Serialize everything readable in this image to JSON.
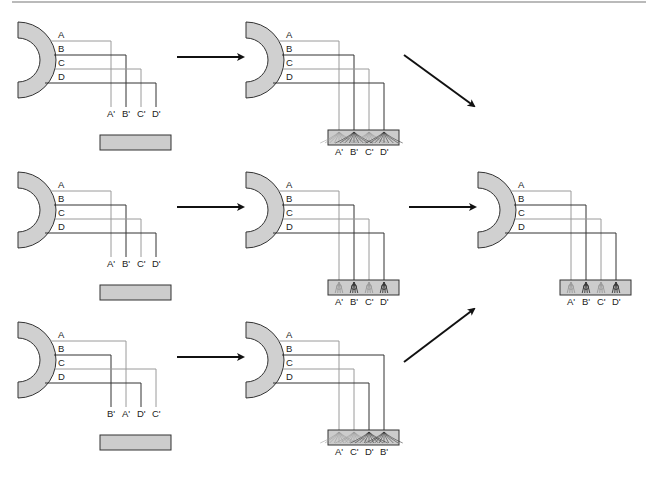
{
  "colors": {
    "arc_fill": "#d0d0d0",
    "arc_stroke": "#333333",
    "box_fill": "#cccccc",
    "box_stroke": "#333333",
    "line_light": "#9a9a9a",
    "line_dark": "#333333",
    "arrow": "#111111",
    "rule": "#777777"
  },
  "panels": [
    {
      "id": "row1-initial",
      "source_labels": [
        "A",
        "B",
        "C",
        "D"
      ],
      "target_labels": [
        "A'",
        "B'",
        "C'",
        "D'"
      ],
      "target_order": [
        0,
        1,
        2,
        3
      ],
      "box_state": "empty"
    },
    {
      "id": "row1-innervated",
      "source_labels": [
        "A",
        "B",
        "C",
        "D"
      ],
      "target_labels": [
        "A'",
        "B'",
        "C'",
        "D'"
      ],
      "target_order": [
        0,
        1,
        2,
        3
      ],
      "box_state": "diffuse-branching"
    },
    {
      "id": "row2-initial",
      "source_labels": [
        "A",
        "B",
        "C",
        "D"
      ],
      "target_labels": [
        "A'",
        "B'",
        "C'",
        "D'"
      ],
      "target_order": [
        0,
        1,
        2,
        3
      ],
      "box_state": "empty"
    },
    {
      "id": "row2-innervated",
      "source_labels": [
        "A",
        "B",
        "C",
        "D"
      ],
      "target_labels": [
        "A'",
        "B'",
        "C'",
        "D'"
      ],
      "target_order": [
        0,
        1,
        2,
        3
      ],
      "box_state": "focused-terminals"
    },
    {
      "id": "row3-initial",
      "source_labels": [
        "A",
        "B",
        "C",
        "D"
      ],
      "target_labels": [
        "B'",
        "A'",
        "D'",
        "C'"
      ],
      "target_order": [
        1,
        0,
        3,
        2
      ],
      "box_state": "empty"
    },
    {
      "id": "row3-innervated",
      "source_labels": [
        "A",
        "B",
        "C",
        "D"
      ],
      "target_labels": [
        "A'",
        "C'",
        "D'",
        "B'"
      ],
      "target_order": [
        0,
        3,
        1,
        2
      ],
      "box_state": "diffuse-branching"
    },
    {
      "id": "final-refined",
      "source_labels": [
        "A",
        "B",
        "C",
        "D"
      ],
      "target_labels": [
        "A'",
        "B'",
        "C'",
        "D'"
      ],
      "target_order": [
        0,
        1,
        2,
        3
      ],
      "box_state": "focused-terminals"
    }
  ],
  "arrows": [
    {
      "id": "row1-arrow",
      "from": "row1-initial",
      "to": "row1-innervated"
    },
    {
      "id": "row2-arrow",
      "from": "row2-initial",
      "to": "row2-innervated"
    },
    {
      "id": "row3-arrow",
      "from": "row3-initial",
      "to": "row3-innervated"
    },
    {
      "id": "row1-to-final-arrow",
      "from": "row1-innervated",
      "to": "final-refined"
    },
    {
      "id": "row2-to-final-arrow",
      "from": "row2-innervated",
      "to": "final-refined"
    },
    {
      "id": "row3-to-final-arrow",
      "from": "row3-innervated",
      "to": "final-refined"
    }
  ]
}
